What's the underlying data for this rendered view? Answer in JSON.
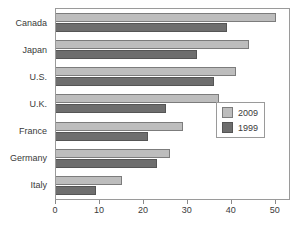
{
  "chart_data": {
    "type": "bar",
    "orientation": "horizontal",
    "title": "",
    "xlabel": "",
    "ylabel": "",
    "categories": [
      "Canada",
      "Japan",
      "U.S.",
      "U.K.",
      "France",
      "Germany",
      "Italy"
    ],
    "series": [
      {
        "name": "2009",
        "color": "#bdbdbd",
        "values": [
          50,
          44,
          41,
          37,
          29,
          26,
          15
        ]
      },
      {
        "name": "1999",
        "color": "#6e6e6e",
        "values": [
          39,
          32,
          36,
          25,
          21,
          23,
          9
        ]
      }
    ],
    "xlim": [
      0,
      53
    ],
    "xticks": [
      0,
      10,
      20,
      30,
      40,
      50
    ],
    "xtick_labels": [
      "0",
      "10",
      "20",
      "30",
      "40",
      "50"
    ],
    "grid": false,
    "legend_position": "center-right",
    "legend_entries": [
      "2009",
      "1999"
    ]
  },
  "colors": {
    "series_2009": "#bdbdbd",
    "series_1999": "#6e6e6e",
    "frame": "#9a9a9a",
    "text": "#3a3a3a",
    "background": "#ffffff"
  }
}
